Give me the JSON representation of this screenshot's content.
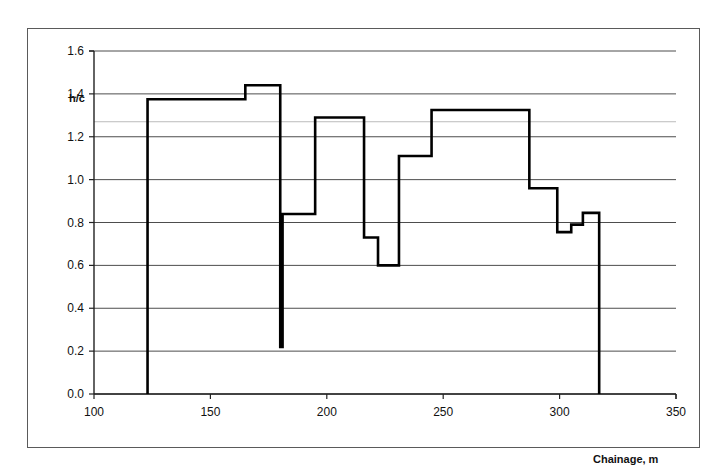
{
  "figure": {
    "background_color": "#ffffff",
    "frame_color": "#5a5a5a",
    "series_color": "#000000",
    "gridline_color": "#4d4d4d",
    "minor_gridline_color": "#b3b3b3"
  },
  "chart_data": {
    "type": "line",
    "title": "",
    "subtitle": "",
    "xlabel": "Chainage, m",
    "ylabel": "h/c",
    "xlim": [
      100,
      350
    ],
    "ylim": [
      0.0,
      1.6
    ],
    "xticks": [
      100,
      150,
      200,
      250,
      300,
      350
    ],
    "xtick_labels": [
      "100",
      "150",
      "200",
      "250",
      "300",
      "350"
    ],
    "yticks": [
      0.0,
      0.2,
      0.4,
      0.6,
      0.8,
      1.0,
      1.2,
      1.4,
      1.6
    ],
    "ytick_labels": [
      "0.0",
      "0.2",
      "0.4",
      "0.6",
      "0.8",
      "1.0",
      "1.2",
      "1.4",
      "1.6"
    ],
    "grid": true,
    "grid_axis": "y",
    "minor_gridlines": [
      1.27
    ],
    "legend": false,
    "legend_position": "none",
    "drawstyle": "steps-post",
    "annotations": [],
    "series": [
      {
        "name": "h/c profile",
        "color": "#000000",
        "line_width": 2.6,
        "x": [
          123,
          123,
          165,
          165,
          180,
          180,
          181,
          181,
          195,
          195,
          216,
          216,
          222,
          222,
          231,
          231,
          232,
          232,
          245,
          245,
          287,
          287,
          299,
          299,
          305,
          305,
          310,
          310,
          317,
          317
        ],
        "y": [
          0.0,
          1.375,
          1.375,
          1.44,
          1.44,
          0.22,
          0.22,
          0.84,
          0.84,
          1.29,
          1.29,
          0.73,
          0.73,
          0.6,
          0.6,
          1.11,
          1.11,
          1.11,
          1.11,
          1.325,
          1.325,
          0.96,
          0.96,
          0.755,
          0.755,
          0.79,
          0.79,
          0.845,
          0.845,
          0.0
        ]
      }
    ],
    "steps": [
      {
        "x_start": 123,
        "x_end": 165,
        "value": 1.375
      },
      {
        "x_start": 165,
        "x_end": 180,
        "value": 1.44
      },
      {
        "x_start": 180,
        "x_end": 181,
        "value": 0.22
      },
      {
        "x_start": 181,
        "x_end": 195,
        "value": 0.84
      },
      {
        "x_start": 195,
        "x_end": 216,
        "value": 1.29
      },
      {
        "x_start": 216,
        "x_end": 222,
        "value": 0.73
      },
      {
        "x_start": 222,
        "x_end": 231,
        "value": 0.6
      },
      {
        "x_start": 231,
        "x_end": 245,
        "value": 1.11
      },
      {
        "x_start": 245,
        "x_end": 287,
        "value": 1.325
      },
      {
        "x_start": 287,
        "x_end": 299,
        "value": 0.96
      },
      {
        "x_start": 299,
        "x_end": 305,
        "value": 0.755
      },
      {
        "x_start": 305,
        "x_end": 310,
        "value": 0.79
      },
      {
        "x_start": 310,
        "x_end": 317,
        "value": 0.845
      }
    ]
  }
}
